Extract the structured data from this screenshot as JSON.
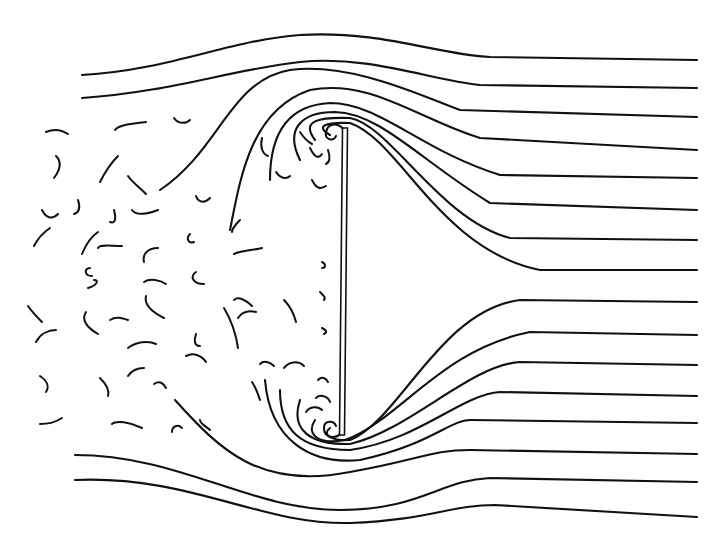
{
  "figure": {
    "background": "#ffffff",
    "ink": "#111111",
    "width": 721,
    "height": 548
  },
  "plate": {
    "x1": 345,
    "y1": 128,
    "x2": 342,
    "y2": 435,
    "thickness": 5
  },
  "streamlines_top": [
    "M82,75 C170,70 230,40 300,35 C380,30 440,55 490,57 L697,60",
    "M82,98 C170,92 230,70 300,62 C370,55 430,80 480,85 L697,88",
    "M160,190 C220,150 230,80 290,70 C350,62 420,95 460,110 L697,117",
    "M230,230 C240,180 250,110 310,90 C370,78 420,120 480,138 L697,150",
    "M270,180 C270,130 290,105 330,103 C380,103 420,150 500,175 L697,178",
    "M300,160 C285,130 300,112 335,112 C380,113 420,160 490,203 L697,210",
    "M315,140 C300,120 320,117 350,118 C390,125 440,220 510,238 L697,240",
    "M330,135 C315,126 325,122 350,123 C400,140 440,250 540,270 L697,270"
  ],
  "streamlines_bottom": [
    "M330,428 C320,436 335,441 350,440 C400,420 440,310 520,300 L697,302",
    "M315,420 C305,435 320,445 345,440 C400,420 440,350 530,332 L697,335",
    "M300,400 C290,430 310,445 350,444 C410,430 470,365 520,362 L697,365",
    "M280,390 C280,430 300,450 350,450 C420,440 460,395 500,392 L697,396",
    "M265,380 C270,440 310,465 360,460 C430,445 450,420 470,420 L697,423",
    "M175,400 C220,450 260,490 350,472 C420,460 430,450 470,450 L697,454",
    "M75,455 C180,455 250,510 340,510 C420,510 440,480 490,478 L697,482",
    "M75,480 C190,475 260,525 350,523 C430,520 450,505 495,505 L697,517"
  ],
  "vortices": [
    "M345,132 C340,122 328,122 326,132 C324,140 334,142 336,136",
    "M342,432 C336,440 324,438 324,428 C324,420 334,420 336,426"
  ],
  "wake_eddies": [
    "M46,132 C55,128 62,130 68,134",
    "M115,130 C118,125 130,124 146,122",
    "M174,118 C178,124 186,124 190,120",
    "M56,156 C62,162 60,170 54,178",
    "M118,156 C112,162 106,170 100,182",
    "M128,176 C132,182 138,186 146,194",
    "M42,210 C46,218 52,220 58,214",
    "M78,200 C80,206 80,212 74,214",
    "M114,210 C116,218 116,224 110,222",
    "M132,210 C136,216 148,214 158,210",
    "M196,196 C198,202 204,204 210,198",
    "M34,246 C38,238 44,232 50,228",
    "M82,254 C86,244 92,236 98,232",
    "M98,248 C100,244 110,246 122,246",
    "M144,262 C142,254 148,248 158,248",
    "M190,234 C186,238 188,244 194,242",
    "M90,268 C84,268 84,276 92,276",
    "M88,288 C96,286 100,280 94,280",
    "M144,282 C150,278 160,280 166,284",
    "M146,296 C144,304 152,312 164,318",
    "M196,272 C190,276 192,284 204,284",
    "M232,232 C232,228 236,224 240,220",
    "M234,254 C242,250 256,250 262,248",
    "M28,306 C32,312 38,318 42,322",
    "M36,342 C40,334 48,330 56,330",
    "M86,312 C82,318 84,326 98,334",
    "M110,320 C116,316 122,318 128,320",
    "M128,348 C136,342 148,340 156,344",
    "M186,356 C194,352 202,356 206,362",
    "M196,334 C194,340 194,346 200,346",
    "M234,300 C238,296 246,300 252,306",
    "M238,318 C242,312 248,310 256,312",
    "M40,376 C46,380 50,386 46,392",
    "M100,378 C106,384 110,390 108,396",
    "M128,376 C132,370 138,368 144,368",
    "M154,384 C160,380 164,384 166,388",
    "M40,424 C48,424 56,422 62,418",
    "M112,424 C116,420 130,422 142,428",
    "M172,432 C172,426 178,424 182,428",
    "M200,420 C200,424 206,426 210,430",
    "M224,308 C230,318 236,334 238,348",
    "M284,300 C290,306 294,314 296,322",
    "M260,364 C264,360 270,362 274,366",
    "M252,382 C256,388 258,394 260,400",
    "M284,368 C288,362 298,360 304,366",
    "M300,132 C304,138 308,142 312,144",
    "M310,148 C314,156 318,160 322,154",
    "M328,150 C330,156 330,162 326,164",
    "M312,180 C316,188 320,190 326,186",
    "M262,138 C260,146 262,154 268,156",
    "M276,172 C280,178 286,180 290,176",
    "M322,262 C326,264 326,268 322,268",
    "M320,292 C324,296 326,298 324,300",
    "M322,328 C326,330 328,332 324,334",
    "M318,380 C322,376 326,378 328,382",
    "M316,398 C320,394 328,396 330,402",
    "M306,412 C310,406 318,406 322,410"
  ]
}
